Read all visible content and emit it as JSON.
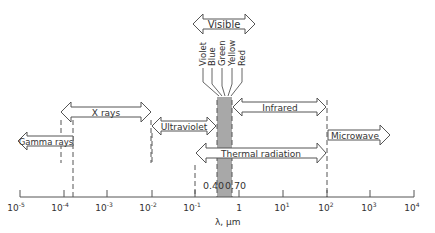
{
  "diagram": {
    "axis": {
      "label": "λ, μm",
      "ticks": [
        {
          "base": "10",
          "exp": "-5",
          "x": 20
        },
        {
          "base": "10",
          "exp": "-4",
          "x": 64
        },
        {
          "base": "10",
          "exp": "-3",
          "x": 107
        },
        {
          "base": "10",
          "exp": "-2",
          "x": 152
        },
        {
          "base": "10",
          "exp": "-1",
          "x": 195
        },
        {
          "base": "1",
          "exp": "",
          "x": 239
        },
        {
          "base": "10",
          "exp": "1",
          "x": 283
        },
        {
          "base": "10",
          "exp": "2",
          "x": 327
        },
        {
          "base": "10",
          "exp": "3",
          "x": 370
        },
        {
          "base": "10",
          "exp": "4",
          "x": 414
        }
      ]
    },
    "visible_band": {
      "lower_label": "0.40",
      "upper_label": "0.70",
      "fill": "#a8a8a8"
    },
    "bands": [
      {
        "id": "gamma",
        "label": "Gamma rays"
      },
      {
        "id": "xrays",
        "label": "X rays"
      },
      {
        "id": "ultraviolet",
        "label": "Ultraviolet"
      },
      {
        "id": "visible",
        "label": "Visible"
      },
      {
        "id": "infrared",
        "label": "Infrared"
      },
      {
        "id": "thermal",
        "label": "Thermal radiation"
      },
      {
        "id": "microwave",
        "label": "Microwave"
      }
    ],
    "colors": [
      "Violet",
      "Blue",
      "Green",
      "Yellow",
      "Red"
    ],
    "stroke_color": "#555555"
  }
}
